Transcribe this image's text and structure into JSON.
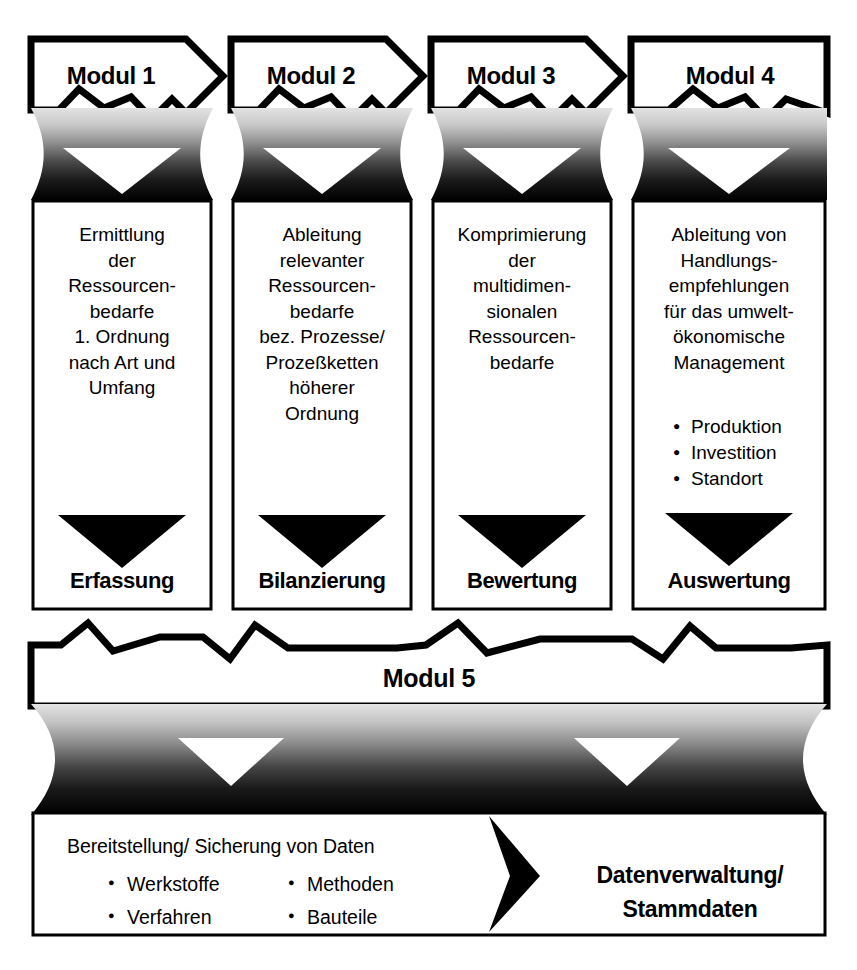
{
  "figure": {
    "background_color": "#ffffff",
    "ink_color": "#000000",
    "gradient_top_color": "#d8d8d8",
    "gradient_bottom_color": "#000000"
  },
  "modules": [
    {
      "header": "Modul 1",
      "body": "Ermittlung\nder\nRessourcen-\nbedarfe\n1. Ordnung\nnach Art und\nUmfang",
      "bullets": [],
      "footer": "Erfassung",
      "arrow_icon": "down-triangle-icon"
    },
    {
      "header": "Modul 2",
      "body": "Ableitung\nrelevanter\nRessourcen-\nbedarfe\nbez. Prozesse/\nProzeßketten\nhöherer\nOrdnung",
      "bullets": [],
      "footer": "Bilanzierung",
      "arrow_icon": "down-triangle-icon"
    },
    {
      "header": "Modul 3",
      "body": "Komprimierung\nder\nmultidimen-\nsionalen\nRessourcen-\nbedarfe",
      "bullets": [],
      "footer": "Bewertung",
      "arrow_icon": "down-triangle-icon"
    },
    {
      "header": "Modul 4",
      "body": "Ableitung von\nHandlungs-\nempfehlungen\nfür das umwelt-\nökonomische\nManagement",
      "bullets": [
        "Produktion",
        "Investition",
        "Standort"
      ],
      "footer": "Auswertung",
      "arrow_icon": "down-triangle-icon"
    }
  ],
  "module5": {
    "header": "Modul 5",
    "data_heading": "Bereitstellung/ Sicherung  von Daten",
    "bullets_left": [
      "Werkstoffe",
      "Verfahren"
    ],
    "bullets_right": [
      "Methoden",
      "Bauteile"
    ],
    "result": "Datenverwaltung/\nStammdaten",
    "arrow_icon": "right-chevron-arrow-icon"
  }
}
